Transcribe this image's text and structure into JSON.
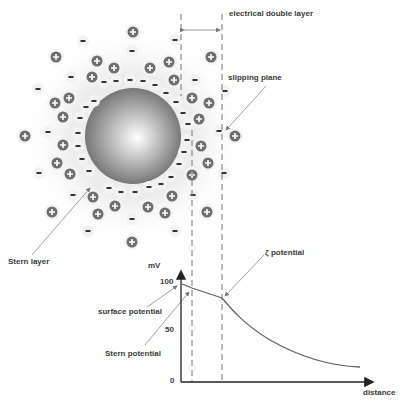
{
  "diagram": {
    "labels": {
      "electrical_double_layer": "electrical double layer",
      "slipping_plane": "slipping plane",
      "stern_layer": "Stern layer",
      "zeta_potential": "ζ potential",
      "surface_potential": "surface potential",
      "stern_potential": "Stern potential",
      "distance": "distance",
      "y_unit": "mV"
    },
    "colors": {
      "ion_fill": "#6e6e6e",
      "line": "#555555",
      "dashed": "#777777",
      "text": "#3a3a3a",
      "particle_dark": "#6a6a6a",
      "particle_light": "#ffffff"
    },
    "particle": {
      "cx": 133,
      "cy": 136,
      "r": 48
    },
    "positive_ions": [
      [
        133,
        32
      ],
      [
        56,
        57
      ],
      [
        97,
        61
      ],
      [
        114,
        68
      ],
      [
        150,
        68
      ],
      [
        169,
        62
      ],
      [
        211,
        57
      ],
      [
        92,
        77
      ],
      [
        174,
        80
      ],
      [
        55,
        103
      ],
      [
        69,
        98
      ],
      [
        63,
        117
      ],
      [
        192,
        98
      ],
      [
        209,
        103
      ],
      [
        200,
        118
      ],
      [
        25,
        136
      ],
      [
        63,
        145
      ],
      [
        199,
        119
      ],
      [
        235,
        136
      ],
      [
        201,
        146
      ],
      [
        57,
        163
      ],
      [
        70,
        174
      ],
      [
        208,
        163
      ],
      [
        192,
        175
      ],
      [
        172,
        196
      ],
      [
        93,
        197
      ],
      [
        115,
        206
      ],
      [
        98,
        214
      ],
      [
        52,
        212
      ],
      [
        148,
        207
      ],
      [
        165,
        213
      ],
      [
        207,
        212
      ],
      [
        132,
        242
      ]
    ],
    "negative_ions": [
      [
        83,
        41
      ],
      [
        132,
        51
      ],
      [
        175,
        40
      ],
      [
        71,
        77
      ],
      [
        38,
        89
      ],
      [
        104,
        82
      ],
      [
        116,
        81
      ],
      [
        130,
        80
      ],
      [
        143,
        81
      ],
      [
        155,
        85
      ],
      [
        166,
        93
      ],
      [
        195,
        80
      ],
      [
        225,
        91
      ],
      [
        94,
        101
      ],
      [
        86,
        107
      ],
      [
        80,
        118
      ],
      [
        176,
        102
      ],
      [
        183,
        113
      ],
      [
        188,
        124
      ],
      [
        48,
        132
      ],
      [
        78,
        133
      ],
      [
        219,
        131
      ],
      [
        187,
        140
      ],
      [
        78,
        146
      ],
      [
        184,
        152
      ],
      [
        82,
        159
      ],
      [
        179,
        164
      ],
      [
        89,
        171
      ],
      [
        39,
        173
      ],
      [
        224,
        173
      ],
      [
        171,
        177
      ],
      [
        161,
        184
      ],
      [
        149,
        187
      ],
      [
        109,
        188
      ],
      [
        121,
        192
      ],
      [
        135,
        192
      ],
      [
        73,
        195
      ],
      [
        193,
        195
      ],
      [
        132,
        219
      ],
      [
        88,
        231
      ],
      [
        175,
        231
      ]
    ]
  },
  "chart_data": {
    "type": "line",
    "title": "",
    "xlabel": "distance",
    "ylabel": "mV",
    "yticks": [
      "0",
      "50",
      "100"
    ],
    "ylim": [
      0,
      100
    ],
    "grid": false,
    "series": [
      {
        "name": "potential",
        "x": [
          0,
          0.06,
          0.22,
          0.35,
          0.5,
          0.65,
          0.8,
          0.92
        ],
        "y": [
          98,
          95,
          84,
          58,
          38,
          24,
          16,
          14
        ]
      }
    ],
    "annotations": [
      {
        "text": "surface potential",
        "x": 0,
        "y": 98
      },
      {
        "text": "Stern potential",
        "x": 0.06,
        "y": 95
      },
      {
        "text": "ζ potential",
        "x": 0.22,
        "y": 84
      }
    ]
  }
}
